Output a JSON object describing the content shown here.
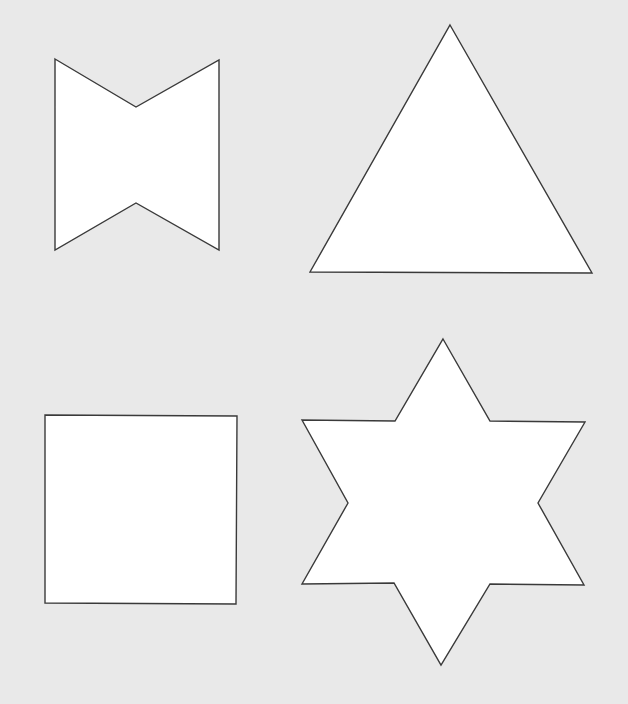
{
  "canvas": {
    "width": 628,
    "height": 704,
    "background": "#e9e9e9"
  },
  "style": {
    "fill": "#ffffff",
    "stroke": "#3a3a3a"
  },
  "shapes": [
    {
      "id": "bowtie",
      "label": "bowtie",
      "points": "55,59 136,107 219,60 219,250 136,203 55,250"
    },
    {
      "id": "triangle",
      "label": "triangle",
      "points": "450,25 592,273 310,272"
    },
    {
      "id": "square",
      "label": "square",
      "points": "45,415 237,416 236,604 45,603"
    },
    {
      "id": "star",
      "label": "six-pointed star",
      "points": "443,339 490,421 585,422 538,503 584,585 490,584 441,665 394,583 302,584 348,503 302,420 395,421"
    }
  ]
}
